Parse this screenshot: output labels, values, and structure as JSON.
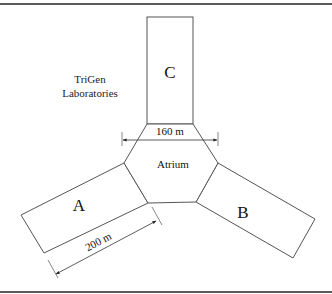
{
  "title": {
    "line1": "TriGen",
    "line2": "Laboratories"
  },
  "buildings": {
    "a": {
      "label": "A"
    },
    "b": {
      "label": "B"
    },
    "c": {
      "label": "C"
    },
    "atrium": {
      "label": "Atrium"
    }
  },
  "dimensions": {
    "atrium_width": "160 m",
    "building_a_length": "200 m"
  },
  "colors": {
    "stroke": "#555555",
    "text": "#111111",
    "rule": "#5a5a5a"
  }
}
